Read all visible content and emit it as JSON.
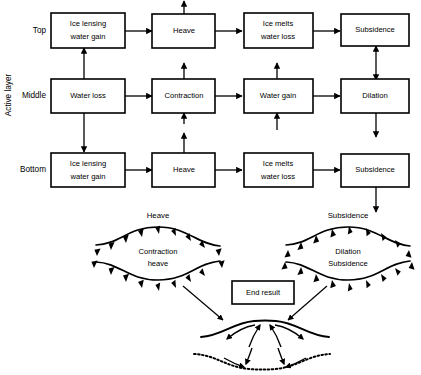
{
  "diagram": {
    "axis_label": "Active layer",
    "row_labels": [
      "Top",
      "Middle",
      "Bottom"
    ],
    "rows": [
      {
        "name": "Top",
        "boxes": [
          {
            "id": "top-ice-lensing",
            "lines": [
              "Ice lensing",
              "water gain"
            ]
          },
          {
            "id": "top-heave",
            "lines": [
              "Heave"
            ]
          },
          {
            "id": "top-ice-melts",
            "lines": [
              "Ice melts",
              "water loss"
            ]
          },
          {
            "id": "top-subsidence",
            "lines": [
              "Subsidence"
            ]
          }
        ]
      },
      {
        "name": "Middle",
        "boxes": [
          {
            "id": "middle-water-loss",
            "lines": [
              "Water loss"
            ]
          },
          {
            "id": "middle-contraction",
            "lines": [
              "Contraction"
            ]
          },
          {
            "id": "middle-water-gain",
            "lines": [
              "Water gain"
            ]
          },
          {
            "id": "middle-dilation",
            "lines": [
              "Dilation"
            ]
          }
        ]
      },
      {
        "name": "Bottom",
        "boxes": [
          {
            "id": "bottom-ice-lensing",
            "lines": [
              "Ice lensing",
              "water gain"
            ]
          },
          {
            "id": "bottom-heave",
            "lines": [
              "Heave"
            ]
          },
          {
            "id": "bottom-ice-melts",
            "lines": [
              "Ice melts",
              "water loss"
            ]
          },
          {
            "id": "bottom-subsidence",
            "lines": [
              "Subsidence"
            ]
          }
        ]
      }
    ],
    "lenses": [
      {
        "id": "heave-lens",
        "title": "Heave",
        "inner_lines": [
          "Contraction",
          "heave"
        ],
        "arrow_direction": "inward"
      },
      {
        "id": "subsidence-lens",
        "title": "Subsidence",
        "inner_lines": [
          "Dilation",
          "Subsidence"
        ],
        "arrow_direction": "outward"
      }
    ],
    "end_result": {
      "label": "End result"
    },
    "colors": {
      "stroke": "#000000",
      "background": "#ffffff",
      "text": "#000000"
    }
  }
}
